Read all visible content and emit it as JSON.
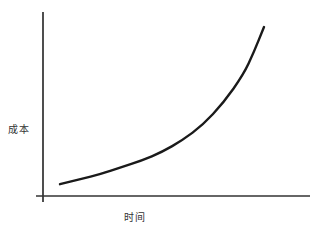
{
  "chart_data": {
    "type": "line",
    "title": "",
    "xlabel": "时间",
    "ylabel": "成本",
    "grid": false,
    "legend": null,
    "ticks": {
      "x": [],
      "y": []
    },
    "series": [
      {
        "name": "成本",
        "shape": "exponential-growth",
        "x": [
          0,
          0.1,
          0.2,
          0.3,
          0.4,
          0.5,
          0.6,
          0.7,
          0.8,
          0.9,
          0.95,
          1.0
        ],
        "y": [
          0.07,
          0.1,
          0.13,
          0.17,
          0.21,
          0.26,
          0.33,
          0.42,
          0.55,
          0.72,
          0.85,
          1.0
        ]
      }
    ],
    "xlim": [
      0,
      1
    ],
    "ylim": [
      0,
      1.05
    ]
  },
  "style": {
    "line_color": "#1a1a1a",
    "axis_color": "#222222"
  }
}
